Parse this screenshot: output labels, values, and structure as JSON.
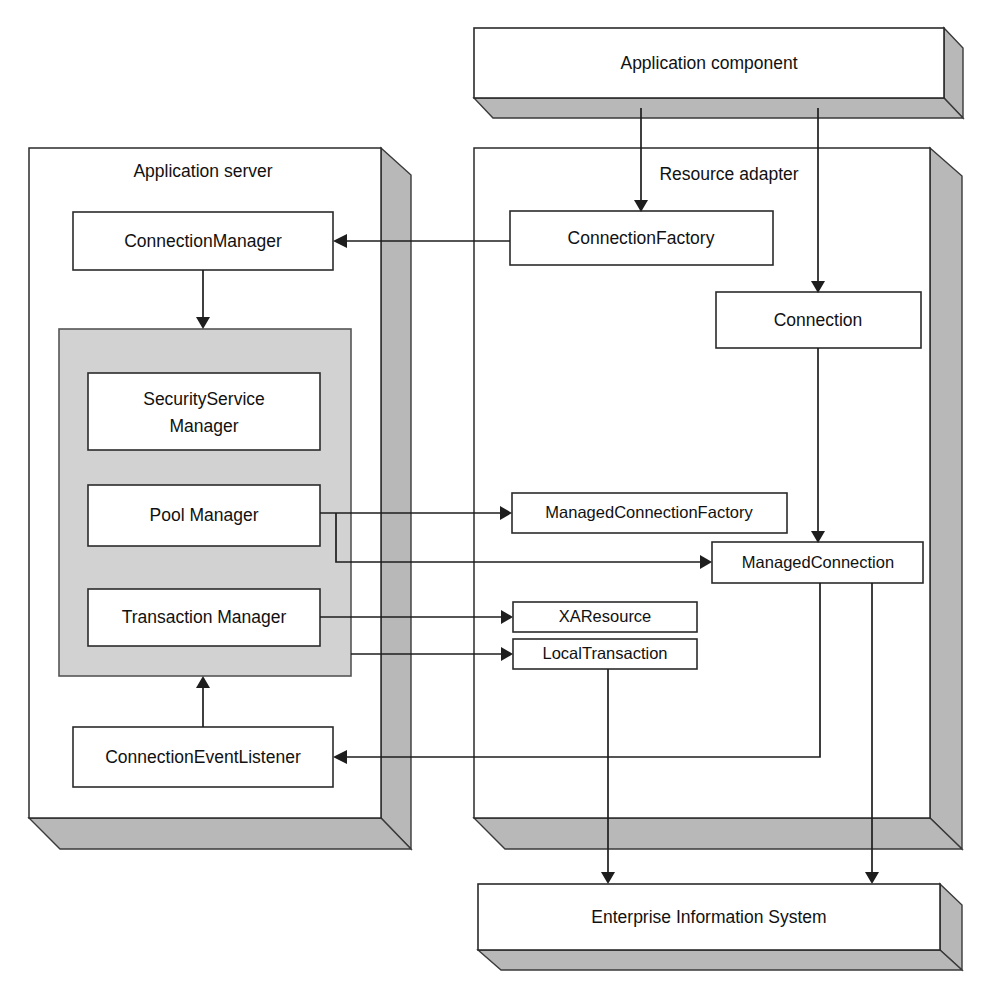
{
  "diagram": {
    "colors": {
      "box_fill": "#ffffff",
      "box_stroke": "#2b2b2b",
      "gray_group_fill": "#d2d2d2",
      "three_d_side_fill": "#b8b8b8",
      "connector_stroke": "#1e1e1e",
      "page_background": "#ffffff"
    },
    "slabs": {
      "application_component": {
        "label": "Application component"
      },
      "enterprise_information_system": {
        "label": "Enterprise Information System"
      }
    },
    "panels": {
      "application_server": {
        "label": "Application server"
      },
      "resource_adapter": {
        "label": "Resource adapter"
      }
    },
    "boxes": {
      "connection_manager": {
        "label": "ConnectionManager"
      },
      "security_service_manager": {
        "label_line1": "SecurityService",
        "label_line2": "Manager"
      },
      "pool_manager": {
        "label": "Pool Manager"
      },
      "transaction_manager": {
        "label": "Transaction Manager"
      },
      "connection_event_listener": {
        "label": "ConnectionEventListener"
      },
      "connection_factory": {
        "label": "ConnectionFactory"
      },
      "connection": {
        "label": "Connection"
      },
      "managed_connection_factory": {
        "label": "ManagedConnectionFactory"
      },
      "managed_connection": {
        "label": "ManagedConnection"
      },
      "xa_resource": {
        "label": "XAResource"
      },
      "local_transaction": {
        "label": "LocalTransaction"
      }
    },
    "connections": [
      {
        "from": "application_component",
        "to": "connection_factory",
        "arrow": "end"
      },
      {
        "from": "application_component",
        "to": "connection",
        "arrow": "end"
      },
      {
        "from": "connection_factory",
        "to": "connection_manager",
        "arrow": "end"
      },
      {
        "from": "connection_manager",
        "to": "security_service_group",
        "arrow": "end"
      },
      {
        "from": "connection",
        "to": "managed_connection",
        "arrow": "end"
      },
      {
        "from": "pool_manager",
        "to": "managed_connection_factory",
        "arrow": "end"
      },
      {
        "from": "pool_manager",
        "to": "managed_connection",
        "arrow": "end"
      },
      {
        "from": "transaction_manager",
        "to": "xa_resource",
        "arrow": "end"
      },
      {
        "from": "transaction_manager",
        "to": "local_transaction",
        "arrow": "end"
      },
      {
        "from": "managed_connection",
        "to": "connection_event_listener",
        "arrow": "end"
      },
      {
        "from": "connection_event_listener",
        "to": "security_service_group",
        "arrow": "end"
      },
      {
        "from": "local_transaction",
        "to": "enterprise_information_system",
        "arrow": "end"
      },
      {
        "from": "managed_connection",
        "to": "enterprise_information_system",
        "arrow": "end"
      }
    ]
  }
}
